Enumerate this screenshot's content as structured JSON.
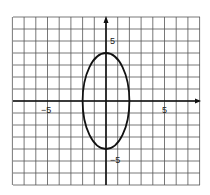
{
  "chart_data": {
    "type": "line",
    "title": "",
    "xlabel": "",
    "ylabel": "",
    "xlim": [
      -8,
      8
    ],
    "ylim": [
      -7,
      7
    ],
    "grid": true,
    "tick_labels": {
      "x": [
        "-5",
        "5"
      ],
      "y": [
        "5",
        "-5"
      ]
    },
    "series": [
      {
        "name": "ellipse",
        "equation": "x^2/4 + y^2/16 = 1",
        "center": [
          0,
          0
        ],
        "semi_axis_x": 2,
        "semi_axis_y": 4
      }
    ]
  },
  "labels": {
    "x_neg5": "−5",
    "x_pos5": "5",
    "y_pos5": "5",
    "y_neg5": "−5"
  }
}
